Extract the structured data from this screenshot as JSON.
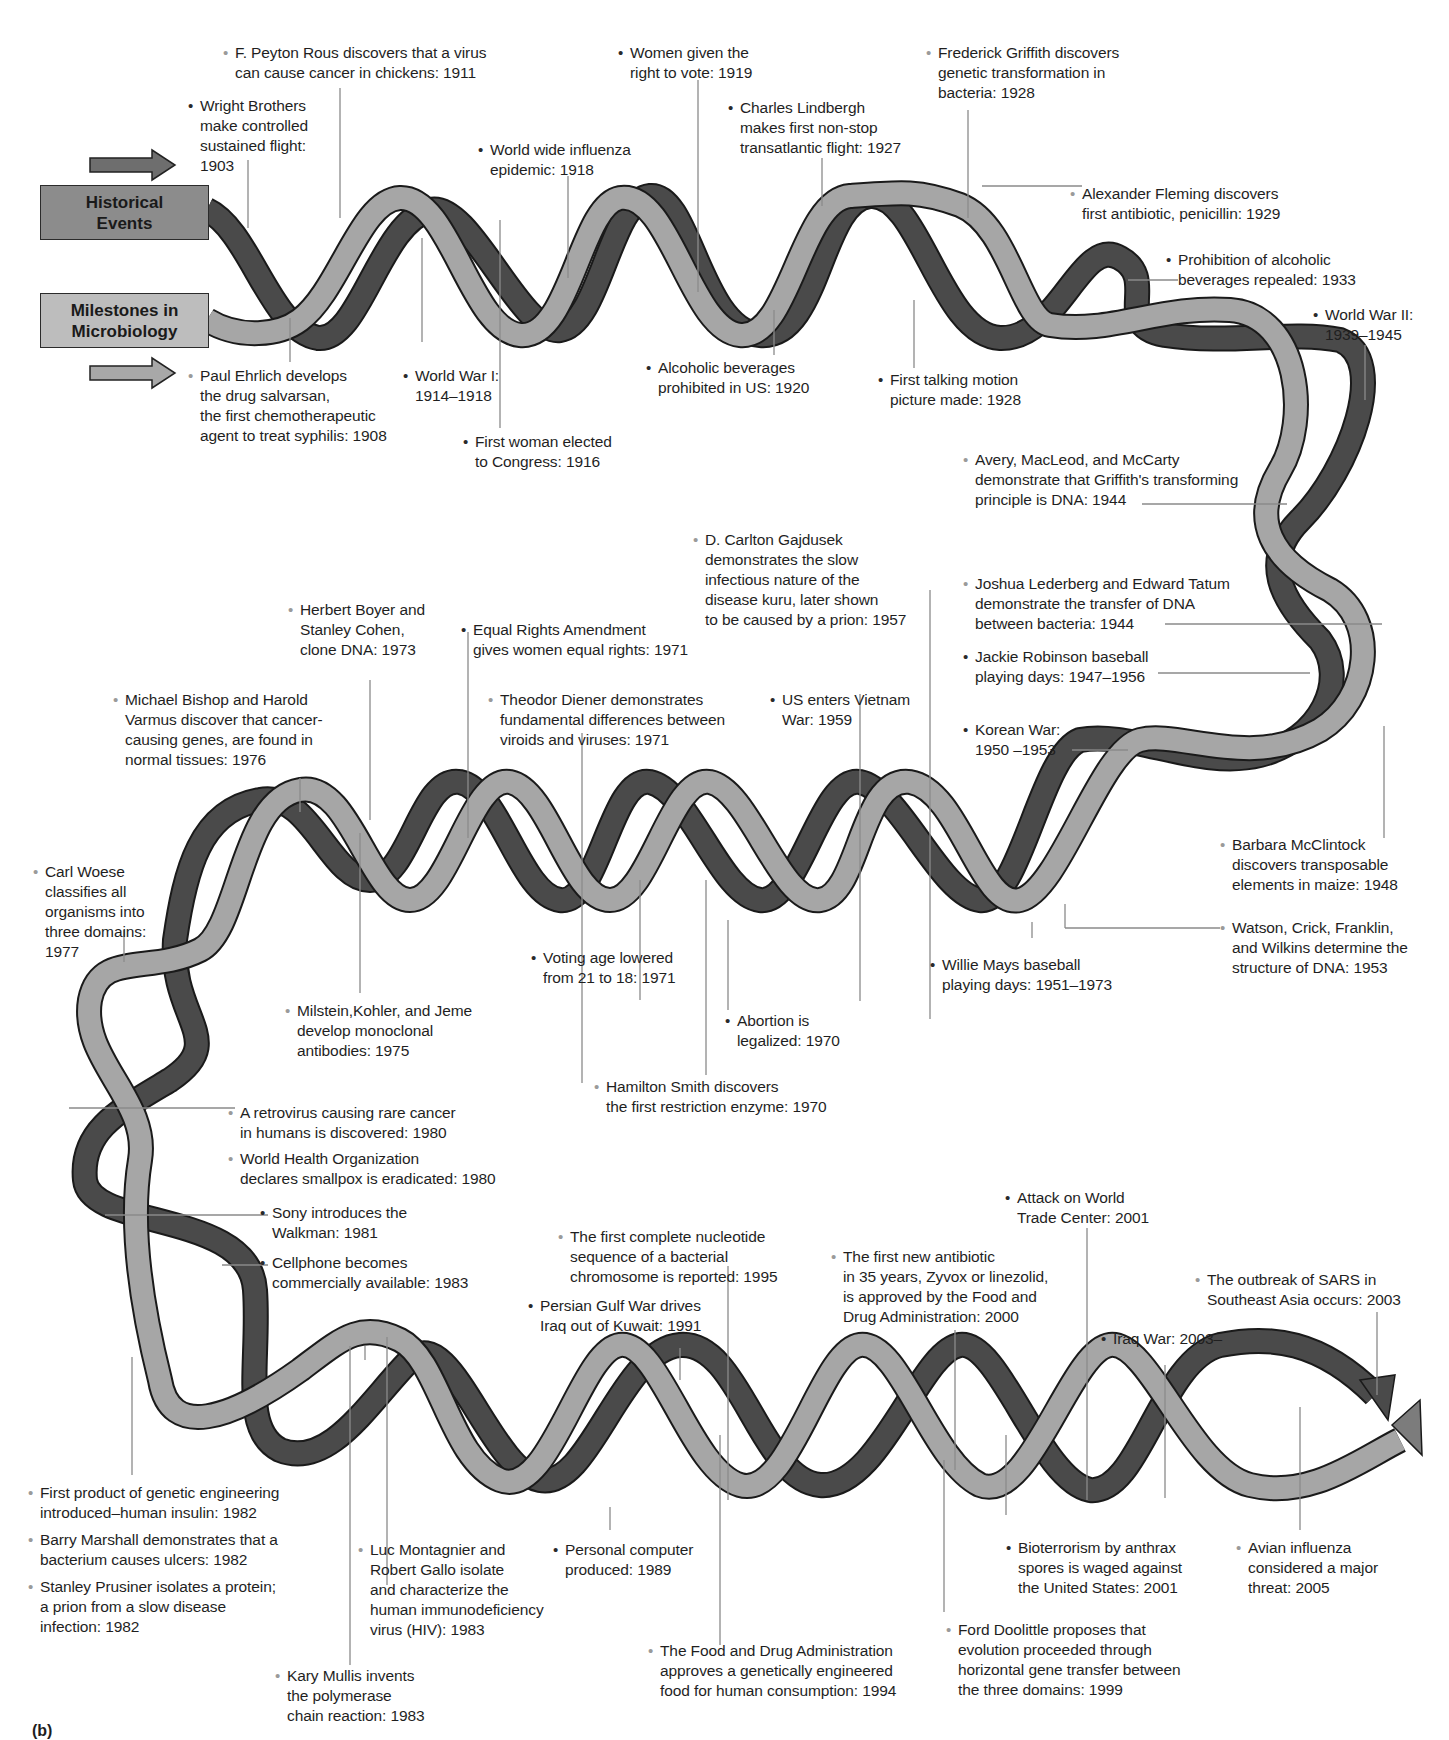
{
  "legend": {
    "historical": "Historical\nEvents",
    "microbiology": "Milestones in\nMicrobiology",
    "historical_color": "#6e6e6e",
    "microbiology_color": "#a8a8a8"
  },
  "figure_label": "(b)",
  "colors": {
    "historical_strand": "#4a4a4a",
    "microbiology_strand": "#a6a6a6",
    "mid_strand": "#7c7c7c",
    "outline": "#1a1a1a",
    "leader_line": "#8a8a8a"
  },
  "events": [
    {
      "type": "micro",
      "text": "F. Peyton Rous discovers that a virus\ncan cause cancer in chickens: 1911",
      "x": 235,
      "y": 43,
      "year": "1911"
    },
    {
      "type": "hist",
      "text": "Wright Brothers\nmake controlled\nsustained flight:\n1903",
      "x": 200,
      "y": 96,
      "year": "1903"
    },
    {
      "type": "hist",
      "text": "Women given the\nright to vote: 1919",
      "x": 630,
      "y": 43,
      "year": "1919"
    },
    {
      "type": "hist",
      "text": "Charles Lindbergh\nmakes first non-stop\ntransatlantic flight: 1927",
      "x": 740,
      "y": 98,
      "year": "1927"
    },
    {
      "type": "hist",
      "text": "World wide influenza\nepidemic: 1918",
      "x": 490,
      "y": 140,
      "year": "1918"
    },
    {
      "type": "micro",
      "text": "Frederick Griffith discovers\ngenetic transformation in\nbacteria: 1928",
      "x": 938,
      "y": 43,
      "year": "1928"
    },
    {
      "type": "micro",
      "text": "Alexander Fleming discovers\nfirst antibiotic, penicillin: 1929",
      "x": 1082,
      "y": 184,
      "year": "1929"
    },
    {
      "type": "hist",
      "text": "Prohibition of alcoholic\nbeverages repealed: 1933",
      "x": 1178,
      "y": 250,
      "year": "1933"
    },
    {
      "type": "hist",
      "text": "World War II:\n1939–1945",
      "x": 1325,
      "y": 305,
      "year": "1939–1945"
    },
    {
      "type": "micro",
      "text": "Paul Ehrlich develops\nthe drug salvarsan,\nthe first chemotherapeutic\nagent to treat syphilis: 1908",
      "x": 200,
      "y": 366,
      "year": "1908"
    },
    {
      "type": "hist",
      "text": "World War I:\n1914–1918",
      "x": 415,
      "y": 366,
      "year": "1914–1918"
    },
    {
      "type": "hist",
      "text": "First woman elected\nto Congress: 1916",
      "x": 475,
      "y": 432,
      "year": "1916"
    },
    {
      "type": "hist",
      "text": "Alcoholic beverages\nprohibited in US: 1920",
      "x": 658,
      "y": 358,
      "year": "1920"
    },
    {
      "type": "hist",
      "text": "First talking motion\npicture made: 1928",
      "x": 890,
      "y": 370,
      "year": "1928"
    },
    {
      "type": "micro",
      "text": "Avery, MacLeod, and McCarty\ndemonstrate that Griffith's transforming\nprinciple is DNA: 1944",
      "x": 975,
      "y": 450,
      "year": "1944"
    },
    {
      "type": "micro",
      "text": "D. Carlton Gajdusek\ndemonstrates the slow\ninfectious nature of the\ndisease kuru, later shown\nto be caused by a prion: 1957",
      "x": 705,
      "y": 530,
      "year": "1957"
    },
    {
      "type": "micro",
      "text": "Joshua Lederberg and Edward Tatum\ndemonstrate the transfer of DNA\nbetween bacteria: 1944",
      "x": 975,
      "y": 574,
      "year": "1944"
    },
    {
      "type": "hist",
      "text": "Jackie Robinson baseball\nplaying days: 1947–1956",
      "x": 975,
      "y": 647,
      "year": "1947–1956"
    },
    {
      "type": "hist",
      "text": "Korean War:\n1950 –1953",
      "x": 975,
      "y": 720,
      "year": "1950–1953"
    },
    {
      "type": "micro",
      "text": "Herbert Boyer and\nStanley Cohen,\nclone DNA: 1973",
      "x": 300,
      "y": 600,
      "year": "1973"
    },
    {
      "type": "hist",
      "text": "Equal Rights Amendment\ngives women equal rights: 1971",
      "x": 473,
      "y": 620,
      "year": "1971"
    },
    {
      "type": "micro",
      "text": "Michael Bishop and Harold\nVarmus discover that cancer-\ncausing genes, are found in\nnormal tissues: 1976",
      "x": 125,
      "y": 690,
      "year": "1976"
    },
    {
      "type": "micro",
      "text": "Theodor Diener demonstrates\nfundamental differences between\nviroids and viruses: 1971",
      "x": 500,
      "y": 690,
      "year": "1971"
    },
    {
      "type": "hist",
      "text": "US enters Vietnam\nWar: 1959",
      "x": 782,
      "y": 690,
      "year": "1959"
    },
    {
      "type": "micro",
      "text": "Carl Woese\nclassifies all\norganisms into\nthree domains:\n1977",
      "x": 45,
      "y": 862,
      "year": "1977"
    },
    {
      "type": "micro",
      "text": "Barbara McClintock\ndiscovers transposable\nelements in maize: 1948",
      "x": 1232,
      "y": 835,
      "year": "1948"
    },
    {
      "type": "micro",
      "text": "Watson, Crick, Franklin,\nand Wilkins determine the\nstructure of DNA: 1953",
      "x": 1232,
      "y": 918,
      "year": "1953"
    },
    {
      "type": "hist",
      "text": "Voting age lowered\nfrom 21 to 18: 1971",
      "x": 543,
      "y": 948,
      "year": "1971"
    },
    {
      "type": "hist",
      "text": "Willie Mays baseball\nplaying days: 1951–1973",
      "x": 942,
      "y": 955,
      "year": "1951–1973"
    },
    {
      "type": "micro",
      "text": "Milstein,Kohler, and Jeme\ndevelop monoclonal\nantibodies: 1975",
      "x": 297,
      "y": 1001,
      "year": "1975"
    },
    {
      "type": "hist",
      "text": "Abortion is\nlegalized: 1970",
      "x": 737,
      "y": 1011,
      "year": "1970"
    },
    {
      "type": "micro",
      "text": "Hamilton Smith discovers\nthe first restriction enzyme: 1970",
      "x": 606,
      "y": 1077,
      "year": "1970"
    },
    {
      "type": "micro",
      "text": "A retrovirus causing rare cancer\nin humans is discovered: 1980",
      "x": 240,
      "y": 1103,
      "year": "1980"
    },
    {
      "type": "micro",
      "text": "World Health Organization\ndeclares smallpox is eradicated: 1980",
      "x": 240,
      "y": 1149,
      "year": "1980"
    },
    {
      "type": "hist",
      "text": "Sony introduces the\nWalkman: 1981",
      "x": 272,
      "y": 1203,
      "year": "1981"
    },
    {
      "type": "hist",
      "text": "Cellphone becomes\ncommercially available: 1983",
      "x": 272,
      "y": 1253,
      "year": "1983"
    },
    {
      "type": "hist",
      "text": "Attack on World\nTrade Center: 2001",
      "x": 1017,
      "y": 1188,
      "year": "2001"
    },
    {
      "type": "micro",
      "text": "The first complete nucleotide\nsequence of a bacterial\nchromosome is reported: 1995",
      "x": 570,
      "y": 1227,
      "year": "1995"
    },
    {
      "type": "micro",
      "text": "The first new antibiotic\nin 35 years, Zyvox or linezolid,\nis approved by the Food and\nDrug Administration: 2000",
      "x": 843,
      "y": 1247,
      "year": "2000"
    },
    {
      "type": "micro",
      "text": "The outbreak of SARS in\nSoutheast Asia occurs: 2003",
      "x": 1207,
      "y": 1270,
      "year": "2003"
    },
    {
      "type": "hist",
      "text": "Persian Gulf War drives\nIraq out of Kuwait: 1991",
      "x": 540,
      "y": 1296,
      "year": "1991"
    },
    {
      "type": "hist",
      "text": "Iraq War: 2003–",
      "x": 1113,
      "y": 1329,
      "year": "2003–"
    },
    {
      "type": "micro",
      "text": "First product of genetic engineering\nintroduced–human insulin: 1982",
      "x": 40,
      "y": 1483,
      "year": "1982"
    },
    {
      "type": "micro",
      "text": "Barry Marshall demonstrates that a\nbacterium causes ulcers: 1982",
      "x": 40,
      "y": 1530,
      "year": "1982"
    },
    {
      "type": "micro",
      "text": "Stanley Prusiner isolates a protein;\na prion from a slow disease\ninfection: 1982",
      "x": 40,
      "y": 1577,
      "year": "1982"
    },
    {
      "type": "micro",
      "text": "Luc Montagnier and\nRobert Gallo isolate\nand characterize the\nhuman immunodeficiency\nvirus (HIV): 1983",
      "x": 370,
      "y": 1540,
      "year": "1983"
    },
    {
      "type": "hist",
      "text": "Personal computer\nproduced: 1989",
      "x": 565,
      "y": 1540,
      "year": "1989"
    },
    {
      "type": "hist",
      "text": "Bioterrorism by anthrax\nspores is waged against\nthe United States: 2001",
      "x": 1018,
      "y": 1538,
      "year": "2001"
    },
    {
      "type": "micro",
      "text": "Avian influenza\nconsidered a major\nthreat: 2005",
      "x": 1248,
      "y": 1538,
      "year": "2005"
    },
    {
      "type": "micro",
      "text": "Kary Mullis invents\nthe polymerase\nchain reaction: 1983",
      "x": 287,
      "y": 1666,
      "year": "1983"
    },
    {
      "type": "micro",
      "text": "The Food and Drug Administration\napproves a genetically engineered\nfood for human consumption: 1994",
      "x": 660,
      "y": 1641,
      "year": "1994"
    },
    {
      "type": "micro",
      "text": "Ford Doolittle proposes that\nevolution proceeded through\nhorizontal gene transfer between\nthe three domains: 1999",
      "x": 958,
      "y": 1620,
      "year": "1999"
    }
  ],
  "leaders": [
    [
      248,
      160,
      248,
      228
    ],
    [
      340,
      88,
      340,
      218
    ],
    [
      568,
      176,
      568,
      278
    ],
    [
      422,
      238,
      422,
      342
    ],
    [
      290,
      318,
      290,
      362
    ],
    [
      698,
      80,
      698,
      292
    ],
    [
      822,
      158,
      822,
      206
    ],
    [
      968,
      110,
      968,
      218
    ],
    [
      982,
      186,
      1082,
      186
    ],
    [
      1128,
      280,
      1178,
      280
    ],
    [
      914,
      300,
      914,
      368
    ],
    [
      774,
      310,
      774,
      355
    ],
    [
      500,
      220,
      500,
      428
    ],
    [
      1365,
      345,
      1365,
      400
    ],
    [
      1142,
      504,
      1287,
      504
    ],
    [
      1165,
      624,
      1382,
      624
    ],
    [
      1158,
      673,
      1310,
      673
    ],
    [
      1072,
      750,
      1128,
      750
    ],
    [
      1384,
      726,
      1384,
      838
    ],
    [
      582,
      1083,
      582,
      733
    ],
    [
      1065,
      904,
      1065,
      928
    ],
    [
      1065,
      928,
      1220,
      928
    ],
    [
      930,
      1019,
      930,
      590
    ],
    [
      860,
      1001,
      860,
      694
    ],
    [
      728,
      1010,
      728,
      920
    ],
    [
      706,
      1075,
      706,
      880
    ],
    [
      370,
      680,
      370,
      820
    ],
    [
      300,
      778,
      300,
      812
    ],
    [
      468,
      632,
      468,
      838
    ],
    [
      1032,
      938,
      1032,
      922
    ],
    [
      124,
      930,
      124,
      962
    ],
    [
      360,
      993,
      360,
      833
    ],
    [
      640,
      1000,
      640,
      880
    ],
    [
      69,
      1108,
      235,
      1108
    ],
    [
      105,
      1215,
      268,
      1215
    ],
    [
      222,
      1265,
      268,
      1265
    ],
    [
      1087,
      1228,
      1087,
      1500
    ],
    [
      728,
      1266,
      728,
      1500
    ],
    [
      955,
      1330,
      955,
      1470
    ],
    [
      1377,
      1312,
      1377,
      1395
    ],
    [
      680,
      1348,
      680,
      1380
    ],
    [
      1165,
      1365,
      1165,
      1498
    ],
    [
      132,
      1357,
      132,
      1475
    ],
    [
      350,
      1346,
      350,
      1665
    ],
    [
      365,
      1346,
      365,
      1360
    ],
    [
      610,
      1507,
      610,
      1530
    ],
    [
      720,
      1435,
      720,
      1645
    ],
    [
      1006,
      1435,
      1006,
      1515
    ],
    [
      1300,
      1407,
      1300,
      1530
    ],
    [
      387,
      1337,
      387,
      1585
    ],
    [
      944,
      1460,
      944,
      1612
    ]
  ]
}
